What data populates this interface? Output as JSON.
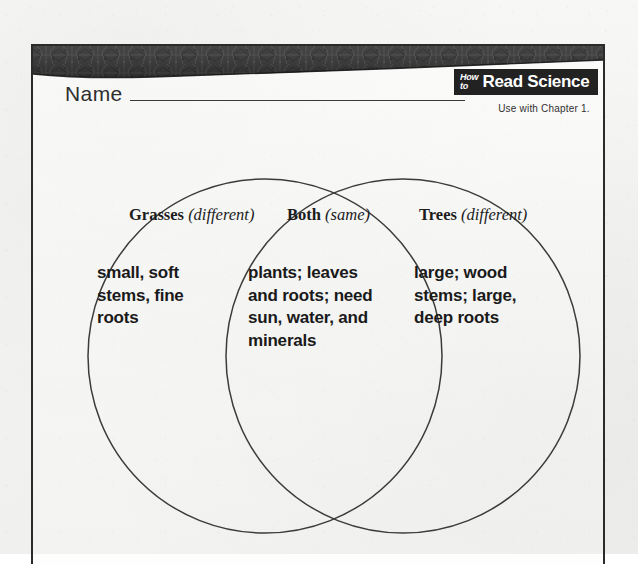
{
  "page": {
    "name_label": "Name",
    "chapter_note": "Use with Chapter 1."
  },
  "logo": {
    "word_how": "How",
    "word_to": "to",
    "title": "Read Science"
  },
  "venn": {
    "left": {
      "title": "Grasses",
      "qualifier": "(different)",
      "body": "small, soft\nstems, fine\nroots"
    },
    "both": {
      "title": "Both",
      "qualifier": "(same)",
      "body": "plants; leaves\nand roots; need\nsun, water, and\nminerals"
    },
    "right": {
      "title": "Trees",
      "qualifier": "(different)",
      "body": "large; wood\nstems; large,\ndeep roots"
    }
  },
  "colors": {
    "ink": "#1c1c1c",
    "badge_bg": "#222222",
    "badge_text": "#ffffff",
    "paper": "#f3f3f1",
    "rule": "#3a3a3a"
  }
}
